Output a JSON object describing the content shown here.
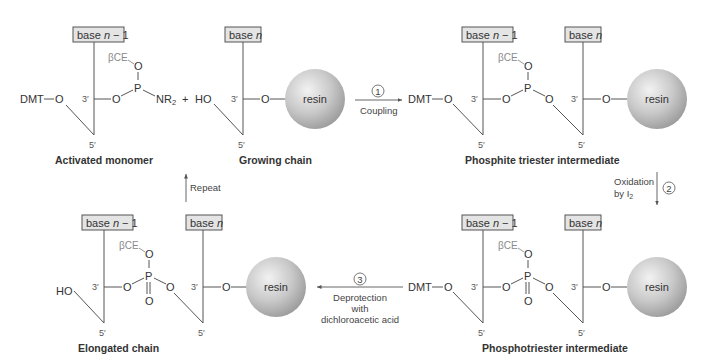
{
  "colors": {
    "background": "#ffffff",
    "line": "#555555",
    "protecting_group_text": "#8a8a8a",
    "base_box_fill": "#e4e4e4",
    "resin_fill": "#c4c4c4"
  },
  "labels": {
    "base_n_minus_1": "base n − 1",
    "base_n_prefix": "base ",
    "base_n_var": "n",
    "minus_one": " − 1",
    "dmt": "DMT",
    "ho": "HO",
    "o": "O",
    "p": "P",
    "nr": "NR",
    "nr_sub": "2",
    "bce": "βCE",
    "three_prime": "3′",
    "five_prime": "5′",
    "plus": "+",
    "resin": "resin"
  },
  "structures": {
    "activated_monomer": "Activated monomer",
    "growing_chain": "Growing chain",
    "phosphite_triester": "Phosphite triester intermediate",
    "phosphotriester": "Phosphotriester intermediate",
    "elongated_chain": "Elongated chain"
  },
  "steps": {
    "step1": {
      "number": "1",
      "label": "Coupling"
    },
    "step2": {
      "number": "2",
      "label_line1": "Oxidation",
      "label_line2": "by I",
      "label_sub": "2"
    },
    "step3": {
      "number": "3",
      "label_line1": "Deprotection",
      "label_line2": "with",
      "label_line3": "dichloroacetic acid"
    },
    "repeat": {
      "label": "Repeat"
    }
  }
}
